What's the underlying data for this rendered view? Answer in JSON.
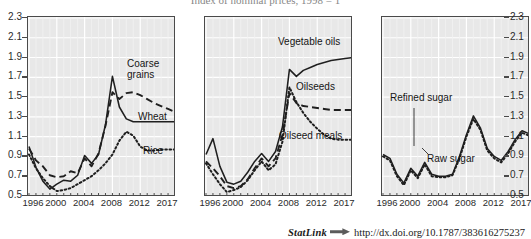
{
  "figure": {
    "title": "Index of nominal prices, 1998 = 1",
    "statlink": {
      "label": "StatLink",
      "glyph_name": "statlink-arrow-icon",
      "url": "http://dx.doi.org/10.1787/383616275237"
    }
  },
  "axis": {
    "y_ticks": [
      "2.3",
      "2.1",
      "1.9",
      "1.7",
      "1.5",
      "1.3",
      "1.1",
      "0.9",
      "0.7",
      "0.5"
    ],
    "y_values": [
      2.3,
      2.1,
      1.9,
      1.7,
      1.5,
      1.3,
      1.1,
      0.9,
      0.7,
      0.5
    ],
    "ylim": [
      0.5,
      2.3
    ],
    "x_ticks": [
      "1996",
      "2000",
      "2004",
      "2008",
      "2012",
      "2017"
    ],
    "x_tick_values": [
      1996,
      2000,
      2004,
      2008,
      2012,
      2017
    ],
    "xlim": [
      1996,
      2017
    ]
  },
  "chart_data": [
    {
      "type": "line",
      "panel": "cereals",
      "title": "Index of nominal prices, 1998 = 1",
      "xlabel": "",
      "ylabel": "Index of nominal prices, 1998 = 1",
      "xlim": [
        1996,
        2017
      ],
      "ylim": [
        0.5,
        2.3
      ],
      "grid": true,
      "legend": "inline-annotations",
      "x": [
        1996,
        1997,
        1998,
        1999,
        2000,
        2001,
        2002,
        2003,
        2004,
        2005,
        2006,
        2007,
        2008,
        2009,
        2010,
        2011,
        2012,
        2013,
        2014,
        2015,
        2016,
        2017
      ],
      "series": [
        {
          "name": "Coarse grains",
          "style": "dashed",
          "values": [
            0.98,
            0.86,
            0.8,
            0.71,
            0.69,
            0.7,
            0.75,
            0.73,
            0.88,
            0.8,
            0.93,
            1.21,
            1.55,
            1.48,
            1.54,
            1.55,
            1.52,
            1.48,
            1.44,
            1.41,
            1.38,
            1.35
          ]
        },
        {
          "name": "Wheat",
          "style": "solid",
          "values": [
            1.0,
            0.79,
            0.65,
            0.57,
            0.62,
            0.66,
            0.65,
            0.71,
            0.91,
            0.83,
            0.92,
            1.22,
            1.71,
            1.4,
            1.28,
            1.25,
            1.25,
            1.25,
            1.25,
            1.25,
            1.25,
            1.25
          ]
        },
        {
          "name": "Rice",
          "style": "dotted",
          "values": [
            0.92,
            0.78,
            0.68,
            0.6,
            0.55,
            0.56,
            0.58,
            0.62,
            0.66,
            0.7,
            0.76,
            0.83,
            0.92,
            1.06,
            1.15,
            1.11,
            1.0,
            0.96,
            0.96,
            0.97,
            0.97,
            0.97
          ]
        }
      ]
    },
    {
      "type": "line",
      "panel": "oilseeds",
      "title": "Index of nominal prices, 1998 = 1",
      "xlabel": "",
      "ylabel": "Index of nominal prices, 1998 = 1",
      "xlim": [
        1996,
        2017
      ],
      "ylim": [
        0.5,
        2.3
      ],
      "grid": true,
      "legend": "inline-annotations",
      "x": [
        1996,
        1997,
        1998,
        1999,
        2000,
        2001,
        2002,
        2003,
        2004,
        2005,
        2006,
        2007,
        2008,
        2009,
        2010,
        2011,
        2012,
        2013,
        2014,
        2015,
        2016,
        2017
      ],
      "series": [
        {
          "name": "Vegetable oils",
          "style": "solid",
          "values": [
            0.92,
            1.08,
            0.8,
            0.64,
            0.62,
            0.65,
            0.74,
            0.85,
            0.93,
            0.85,
            0.95,
            1.2,
            1.78,
            1.71,
            1.77,
            1.8,
            1.83,
            1.85,
            1.87,
            1.88,
            1.89,
            1.9
          ]
        },
        {
          "name": "Oilseeds",
          "style": "dashed",
          "values": [
            0.85,
            0.78,
            0.7,
            0.6,
            0.58,
            0.6,
            0.67,
            0.78,
            0.88,
            0.8,
            0.88,
            1.12,
            1.54,
            1.44,
            1.41,
            1.4,
            1.39,
            1.38,
            1.37,
            1.37,
            1.37,
            1.37
          ]
        },
        {
          "name": "Oilseed meals",
          "style": "dotted",
          "values": [
            0.83,
            0.72,
            0.62,
            0.54,
            0.56,
            0.59,
            0.66,
            0.76,
            0.85,
            0.76,
            0.82,
            1.05,
            1.6,
            1.45,
            1.34,
            1.25,
            1.18,
            1.12,
            1.08,
            1.07,
            1.07,
            1.07
          ]
        }
      ]
    },
    {
      "type": "line",
      "panel": "sugar",
      "title": "Index of nominal prices, 1998 = 1",
      "xlabel": "",
      "ylabel": "Index of nominal prices, 1998 = 1",
      "xlim": [
        1996,
        2017
      ],
      "ylim": [
        0.5,
        2.3
      ],
      "grid": true,
      "legend": "inline-annotations",
      "x": [
        1996,
        1997,
        1998,
        1999,
        2000,
        2001,
        2002,
        2003,
        2004,
        2005,
        2006,
        2007,
        2008,
        2009,
        2010,
        2011,
        2012,
        2013,
        2014,
        2015,
        2016,
        2017
      ],
      "series": [
        {
          "name": "Refined sugar",
          "style": "solid",
          "values": [
            0.92,
            0.88,
            0.72,
            0.63,
            0.78,
            0.7,
            0.84,
            0.72,
            0.7,
            0.7,
            0.72,
            0.9,
            1.12,
            1.31,
            1.19,
            0.98,
            0.9,
            0.86,
            0.95,
            1.07,
            1.16,
            1.13
          ]
        },
        {
          "name": "Raw sugar",
          "style": "dotted",
          "values": [
            0.9,
            0.86,
            0.7,
            0.61,
            0.76,
            0.68,
            0.82,
            0.7,
            0.69,
            0.69,
            0.71,
            0.88,
            1.1,
            1.28,
            1.17,
            0.96,
            0.88,
            0.84,
            0.93,
            1.05,
            1.14,
            1.11
          ]
        }
      ]
    }
  ],
  "annotations": {
    "cereals": [
      {
        "id": "coarse-grains",
        "text_line1": "Coarse",
        "text_line2": "grains"
      },
      {
        "id": "wheat",
        "text": "Wheat"
      },
      {
        "id": "rice",
        "text": "Rice"
      }
    ],
    "oilseeds": [
      {
        "id": "vegetable-oils",
        "text": "Vegetable oils"
      },
      {
        "id": "oilseeds",
        "text": "Oilseeds"
      },
      {
        "id": "oilseed-meals",
        "text": "Oilseed meals"
      }
    ],
    "sugar": [
      {
        "id": "refined-sugar",
        "text": "Refined sugar"
      },
      {
        "id": "raw-sugar",
        "text": "Raw sugar"
      }
    ]
  }
}
